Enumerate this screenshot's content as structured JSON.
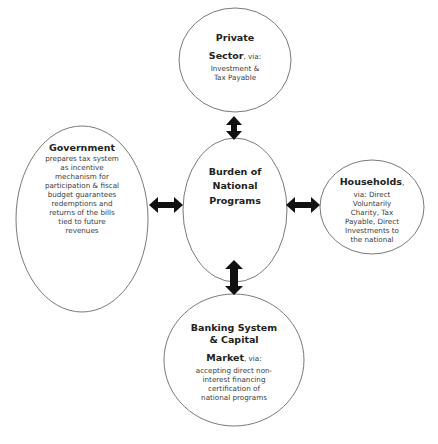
{
  "diagram": {
    "center": {
      "lines": [
        "Burden of",
        "National",
        "Programs"
      ]
    },
    "nodes": {
      "private_sector": {
        "title_lines": [
          "Private",
          "Sector"
        ],
        "via": ", via:",
        "body_lines": [
          "Investment &",
          "Tax Payable"
        ]
      },
      "government": {
        "title": "Government",
        "body_lines": [
          "prepares tax system",
          "as incentive",
          "mechanism for",
          "participation & fiscal",
          "budget  guarantees",
          "redemptions and",
          "returns of the bills",
          "tied to future",
          "revenues"
        ]
      },
      "households": {
        "title": "Households",
        "via": ",",
        "body_lines": [
          "via: Direct",
          "Voluntarily",
          "Charity, Tax",
          "Payable, Direct",
          "Investments to",
          "the national"
        ]
      },
      "banking": {
        "title_lines": [
          "Banking System",
          "& Capital",
          "Market"
        ],
        "via": ", via:",
        "body_lines": [
          "accepting direct non-",
          "interest financing",
          "certification of",
          "national programs"
        ]
      }
    },
    "connectors": [
      {
        "from": "private_sector",
        "to": "center",
        "type": "double-arrow"
      },
      {
        "from": "government",
        "to": "center",
        "type": "double-arrow"
      },
      {
        "from": "households",
        "to": "center",
        "type": "double-arrow"
      },
      {
        "from": "banking",
        "to": "center",
        "type": "double-arrow"
      }
    ],
    "colors": {
      "ellipse_stroke": "#7a7a7a",
      "arrow_fill": "#111111",
      "text": "#2b2b2b"
    }
  }
}
